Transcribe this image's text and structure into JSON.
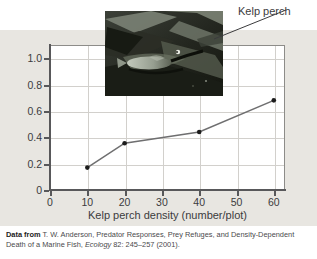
{
  "figure": {
    "cropped_top_text": "",
    "photo_alt": "underwater-kelp-photo",
    "callout_label": "Kelp perch"
  },
  "chart_data": {
    "type": "line",
    "title": "",
    "xlabel": "Kelp perch density (number/plot)",
    "ylabel": "Proportional death rate",
    "x": [
      10,
      20,
      40,
      60
    ],
    "values": [
      0.17,
      0.355,
      0.44,
      0.68
    ],
    "xlim": [
      0,
      63
    ],
    "ylim": [
      0,
      1.1
    ],
    "xticks": [
      0,
      10,
      20,
      30,
      40,
      50,
      60
    ],
    "xtick_labels": [
      "0",
      "10",
      "20",
      "30",
      "40",
      "50",
      "60"
    ],
    "yticks": [
      0,
      0.2,
      0.4,
      0.6,
      0.8,
      1.0
    ],
    "ytick_labels": [
      "0",
      "0.2",
      "0.4",
      "0.6",
      "0.8",
      "1.0"
    ],
    "grid": true,
    "legend": "none",
    "line_color": "#6f6f70",
    "marker_color": "#1c1c1c",
    "series": [
      {
        "name": "Proportional death rate",
        "values": [
          0.17,
          0.355,
          0.44,
          0.68
        ]
      }
    ]
  },
  "caption": {
    "prefix": "Data from",
    "line1": "T. W. Anderson, Predator Responses, Prey Refuges, and Density-Dependent",
    "line2_before": "Death  of a Marine Fish,",
    "journal": "Ecology",
    "line2_after": "82: 245–257 (2001)."
  }
}
